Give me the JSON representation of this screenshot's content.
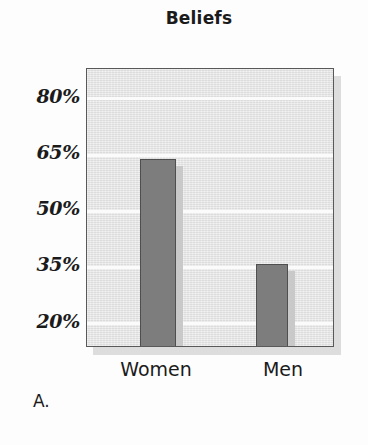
{
  "panel": {
    "label": "A."
  },
  "chart_data": {
    "type": "bar",
    "title": "Beliefs",
    "xlabel": "",
    "ylabel": "",
    "categories": [
      "Women",
      "Men"
    ],
    "values": [
      64,
      36
    ],
    "value_unit": "%",
    "ylim": [
      13.5,
      88
    ],
    "yticks": [
      20,
      35,
      50,
      65,
      80
    ],
    "ytick_labels": [
      "20%",
      "35%",
      "50%",
      "65%",
      "80%"
    ],
    "grid": true,
    "grid_color": "#fbfbfb",
    "legend": null,
    "legend_position": "none",
    "series": [
      {
        "name": "Beliefs",
        "values": [
          64,
          36
        ],
        "color": "#7d7d7d",
        "edge_color": "#4f4f4f"
      }
    ],
    "plot_background": "#e5e5e5",
    "frame_color": "#595959"
  }
}
